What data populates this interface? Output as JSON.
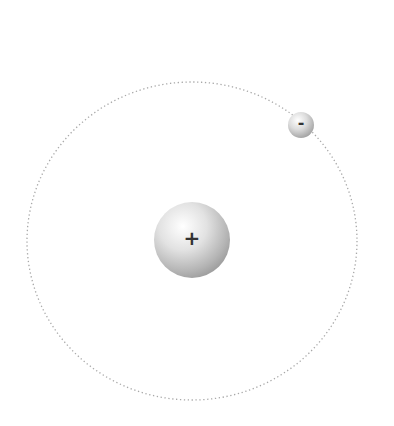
{
  "diagram": {
    "type": "atom-model",
    "nucleus": {
      "label": "+",
      "cx": 192,
      "cy": 240,
      "r": 38
    },
    "electron": {
      "label": "-",
      "cx": 301,
      "cy": 125,
      "r": 13
    },
    "orbit": {
      "cx": 192,
      "cy": 241,
      "rx": 165,
      "ry": 159,
      "style": "dotted",
      "color": "#a8a8a8"
    }
  }
}
